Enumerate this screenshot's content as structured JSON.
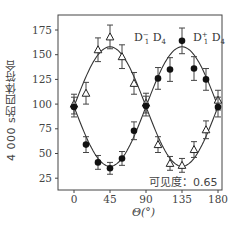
{
  "chart_data": {
    "type": "scatter",
    "title": "",
    "xlabel": "Θ(°)",
    "ylabel": "4 000 s的四体符合",
    "xlim": [
      -15,
      195
    ],
    "ylim": [
      15,
      190
    ],
    "xticks": [
      0,
      45,
      90,
      135,
      180
    ],
    "yticks": [
      25,
      50,
      75,
      100,
      125,
      150,
      175
    ],
    "grid": false,
    "x": [
      0,
      15,
      30,
      45,
      60,
      75,
      90,
      105,
      120,
      135,
      150,
      165,
      180
    ],
    "series": [
      {
        "name": "D1⁻ D4",
        "marker": "open-triangle",
        "values": [
          100,
          111,
          155,
          168,
          148,
          121,
          101,
          59,
          40,
          38,
          54,
          74,
          104
        ],
        "errors": [
          10,
          11,
          12,
          12,
          12,
          11,
          10,
          8,
          7,
          7,
          8,
          9,
          10
        ],
        "fit": "sinusoid"
      },
      {
        "name": "D1⁺ D4",
        "marker": "filled-circle",
        "values": [
          97,
          59,
          41,
          35,
          45,
          73,
          98,
          126,
          135,
          164,
          136,
          125,
          97
        ],
        "errors": [
          10,
          8,
          7,
          6,
          7,
          9,
          10,
          11,
          12,
          13,
          12,
          11,
          10
        ],
        "fit": "sinusoid"
      }
    ],
    "annotations": [
      {
        "text": "D1⁻ D4",
        "near_x": 90,
        "near_y": 160
      },
      {
        "text": "D1⁺ D4",
        "near_x": 165,
        "near_y": 160
      },
      {
        "text": "可见度：0.65",
        "position": "bottom-right"
      }
    ],
    "legend": "inline-annotations"
  },
  "labels": {
    "ylabel": "4 000 s的四体符合",
    "xlabel": "Θ(°)",
    "series_a": "D",
    "series_a_sub": "1",
    "series_a_sup": "−",
    "series_a_rest": " D",
    "series_a_rest_sub": "4",
    "series_b": "D",
    "series_b_sub": "1",
    "series_b_sup": "+",
    "series_b_rest": " D",
    "series_b_rest_sub": "4",
    "visibility": "可见度：0.65"
  }
}
